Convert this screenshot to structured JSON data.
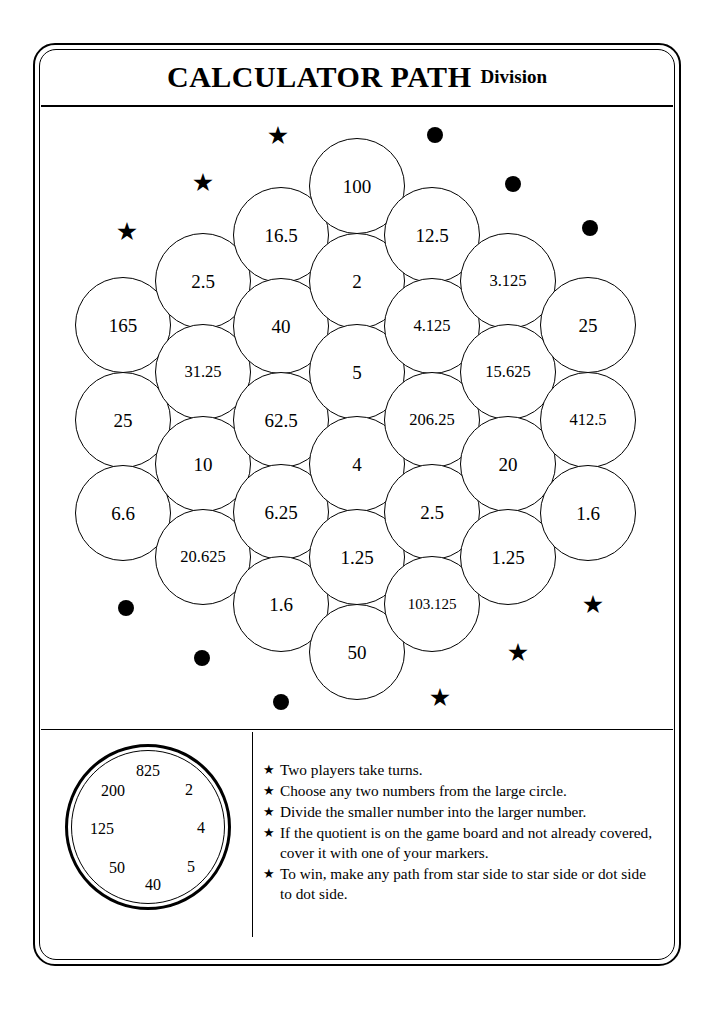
{
  "header": {
    "title_main": "CALCULATOR PATH",
    "title_sub": "Division"
  },
  "board": {
    "columns": [
      {
        "index": 0,
        "cx": 123,
        "cy_start": 325,
        "cells": [
          {
            "value": "165",
            "cx": 123,
            "cy": 325
          },
          {
            "value": "25",
            "cx": 123,
            "cy": 420
          },
          {
            "value": "6.6",
            "cx": 123,
            "cy": 513
          }
        ]
      },
      {
        "index": 1,
        "cx": 203,
        "cells": [
          {
            "value": "2.5",
            "cx": 203,
            "cy": 281
          },
          {
            "value": "31.25",
            "cx": 203,
            "cy": 372
          },
          {
            "value": "10",
            "cx": 203,
            "cy": 464
          },
          {
            "value": "20.625",
            "cx": 203,
            "cy": 557
          }
        ]
      },
      {
        "index": 2,
        "cx": 281,
        "cells": [
          {
            "value": "16.5",
            "cx": 281,
            "cy": 235
          },
          {
            "value": "40",
            "cx": 281,
            "cy": 326
          },
          {
            "value": "62.5",
            "cx": 281,
            "cy": 420
          },
          {
            "value": "6.25",
            "cx": 281,
            "cy": 512
          },
          {
            "value": "1.6",
            "cx": 281,
            "cy": 604
          }
        ]
      },
      {
        "index": 3,
        "cx": 357,
        "cells": [
          {
            "value": "100",
            "cx": 357,
            "cy": 186
          },
          {
            "value": "2",
            "cx": 357,
            "cy": 281
          },
          {
            "value": "5",
            "cx": 357,
            "cy": 372
          },
          {
            "value": "4",
            "cx": 357,
            "cy": 464
          },
          {
            "value": "1.25",
            "cx": 357,
            "cy": 557
          },
          {
            "value": "50",
            "cx": 357,
            "cy": 652
          }
        ]
      },
      {
        "index": 4,
        "cx": 432,
        "cells": [
          {
            "value": "12.5",
            "cx": 432,
            "cy": 235
          },
          {
            "value": "4.125",
            "cx": 432,
            "cy": 326
          },
          {
            "value": "206.25",
            "cx": 432,
            "cy": 420
          },
          {
            "value": "2.5",
            "cx": 432,
            "cy": 512
          },
          {
            "value": "103.125",
            "cx": 432,
            "cy": 604
          }
        ]
      },
      {
        "index": 5,
        "cx": 508,
        "cells": [
          {
            "value": "3.125",
            "cx": 508,
            "cy": 281
          },
          {
            "value": "15.625",
            "cx": 508,
            "cy": 372
          },
          {
            "value": "20",
            "cx": 508,
            "cy": 464
          },
          {
            "value": "1.25",
            "cx": 508,
            "cy": 557
          }
        ]
      },
      {
        "index": 6,
        "cx": 588,
        "cells": [
          {
            "value": "25",
            "cx": 588,
            "cy": 325
          },
          {
            "value": "412.5",
            "cx": 588,
            "cy": 420
          },
          {
            "value": "1.6",
            "cx": 588,
            "cy": 513
          }
        ]
      }
    ],
    "markers": {
      "top_left_stars": [
        {
          "x": 127,
          "y": 231
        },
        {
          "x": 203,
          "y": 182
        },
        {
          "x": 278,
          "y": 135
        }
      ],
      "top_right_dots": [
        {
          "x": 435,
          "y": 135
        },
        {
          "x": 513,
          "y": 184
        },
        {
          "x": 590,
          "y": 228
        }
      ],
      "bottom_left_dots": [
        {
          "x": 126,
          "y": 608
        },
        {
          "x": 202,
          "y": 658
        },
        {
          "x": 281,
          "y": 702
        }
      ],
      "bottom_right_stars": [
        {
          "x": 593,
          "y": 604
        },
        {
          "x": 518,
          "y": 652
        },
        {
          "x": 440,
          "y": 697
        }
      ],
      "star_glyph": "★",
      "dot_glyph": "●"
    }
  },
  "spinner": {
    "numbers": [
      {
        "label": "825",
        "x": 107,
        "y": 39
      },
      {
        "label": "200",
        "x": 72,
        "y": 59
      },
      {
        "label": "2",
        "x": 148,
        "y": 58
      },
      {
        "label": "125",
        "x": 61,
        "y": 97
      },
      {
        "label": "4",
        "x": 160,
        "y": 96
      },
      {
        "label": "50",
        "x": 76,
        "y": 136
      },
      {
        "label": "5",
        "x": 150,
        "y": 135
      },
      {
        "label": "40",
        "x": 112,
        "y": 153
      }
    ]
  },
  "rules": {
    "bullet": "★",
    "items": [
      "Two players take turns.",
      "Choose any two numbers from the large circle.",
      "Divide the smaller number into the larger number.",
      "If the quotient is on the game board and not already covered, cover it with one of your markers.",
      "To win, make any path from star side to star side or dot side to dot side."
    ]
  },
  "style": {
    "ink": "#000000",
    "paper": "#ffffff"
  }
}
